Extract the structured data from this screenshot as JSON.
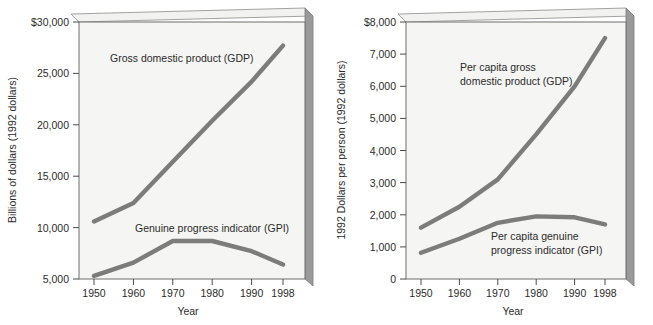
{
  "colors": {
    "line": "#7c7c7c",
    "plot_background": "#f5f5f3",
    "frame": "#6e6e6e",
    "side_panel": "#9a9a9a",
    "top_panel": "#f2f2f0",
    "text": "#2b2b2b"
  },
  "chart_data": [
    {
      "type": "line",
      "id": "total-gdp-gpi",
      "title": "",
      "xlabel": "Year",
      "ylabel": "Billions of dollars (1992 dollars)",
      "x": [
        1950,
        1960,
        1970,
        1980,
        1990,
        1998
      ],
      "xtick_labels": [
        "1950",
        "1960",
        "1970",
        "1980",
        "1990",
        "1998"
      ],
      "ylim": [
        5000,
        30000
      ],
      "ytick_values": [
        5000,
        10000,
        15000,
        20000,
        25000,
        30000
      ],
      "ytick_labels": [
        "5,000",
        "10,000",
        "15,000",
        "20,000",
        "25,000",
        "$30,000"
      ],
      "grid": false,
      "legend_position": "inline-annotation",
      "series": [
        {
          "name": "Gross domestic product (GDP)",
          "label_text": "Gross domestic product (GDP)",
          "values": [
            10600,
            12400,
            16400,
            20400,
            24200,
            27700
          ]
        },
        {
          "name": "Genuine progress indicator (GPI)",
          "label_text": "Genuine progress indicator (GPI)",
          "values": [
            5300,
            6600,
            8700,
            8700,
            7700,
            6400
          ]
        }
      ]
    },
    {
      "type": "line",
      "id": "per-capita-gdp-gpi",
      "title": "",
      "xlabel": "Year",
      "ylabel": "1992 Dollars per person (1992 dollars)",
      "x": [
        1950,
        1960,
        1970,
        1980,
        1990,
        1998
      ],
      "xtick_labels": [
        "1950",
        "1960",
        "1970",
        "1980",
        "1990",
        "1998"
      ],
      "ylim": [
        0,
        8000
      ],
      "ytick_values": [
        0,
        1000,
        2000,
        3000,
        4000,
        5000,
        6000,
        7000,
        8000
      ],
      "ytick_labels": [
        "0",
        "1,000",
        "2,000",
        "3,000",
        "4,000",
        "5,000",
        "6,000",
        "7,000",
        "$8,000"
      ],
      "grid": false,
      "legend_position": "inline-annotation",
      "series": [
        {
          "name": "Per capita gross domestic product (GDP)",
          "label_line1": "Per capita gross",
          "label_line2": "domestic product (GDP)",
          "values": [
            1600,
            2250,
            3100,
            4500,
            6000,
            7500
          ]
        },
        {
          "name": "Per capita genuine progress indicator (GPI)",
          "label_line1": "Per capita genuine",
          "label_line2": "progress indicator (GPI)",
          "values": [
            820,
            1250,
            1750,
            1950,
            1920,
            1700
          ]
        }
      ]
    }
  ]
}
